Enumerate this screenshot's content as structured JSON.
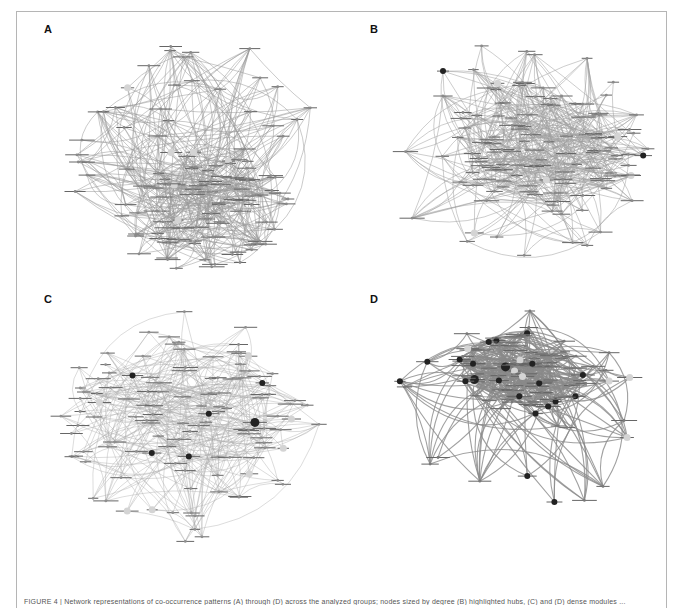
{
  "figure": {
    "panels": [
      {
        "id": "A",
        "label": "A",
        "left": 16,
        "top": 11,
        "seed": 11,
        "nodes": 120,
        "edges": 360,
        "cluster": {
          "cx": 0.55,
          "cy": 0.72,
          "spread": 0.22,
          "weight": 0.55
        },
        "edge_color": "#9a9a9a",
        "edge_width": 0.7,
        "edge_opacity": 0.75,
        "node_color": "#8a8a8a",
        "dark_nodes": 0,
        "big_nodes": 6
      },
      {
        "id": "B",
        "label": "B",
        "left": 342,
        "top": 11,
        "seed": 23,
        "nodes": 125,
        "edges": 380,
        "cluster": {
          "cx": 0.62,
          "cy": 0.5,
          "spread": 0.25,
          "weight": 0.6
        },
        "edge_color": "#a0a0a0",
        "edge_width": 0.7,
        "edge_opacity": 0.75,
        "node_color": "#8a8a8a",
        "dark_nodes": 2,
        "big_nodes": 5
      },
      {
        "id": "C",
        "label": "C",
        "left": 16,
        "top": 281,
        "seed": 37,
        "nodes": 120,
        "edges": 300,
        "cluster": {
          "cx": 0.5,
          "cy": 0.45,
          "spread": 0.28,
          "weight": 0.45
        },
        "edge_color": "#aaaaaa",
        "edge_width": 0.6,
        "edge_opacity": 0.7,
        "node_color": "#8f8f8f",
        "dark_nodes": 6,
        "big_nodes": 8
      },
      {
        "id": "D",
        "label": "D",
        "left": 342,
        "top": 281,
        "seed": 51,
        "nodes": 110,
        "edges": 340,
        "cluster": {
          "cx": 0.55,
          "cy": 0.33,
          "spread": 0.16,
          "weight": 0.65
        },
        "edge_color": "#8a8a8a",
        "edge_width": 1.1,
        "edge_opacity": 0.8,
        "node_color": "#7a7a7a",
        "dark_nodes": 22,
        "big_nodes": 10
      }
    ],
    "dark_node_color": "#222222",
    "halo_color": "#d4d4d4",
    "label_color": "#666666"
  },
  "caption": {
    "text": "FIGURE 4 | Network representations of co-occurrence patterns (A) through (D) across the analyzed groups; nodes sized by degree (B) highlighted hubs, (C) and (D) dense modules ..."
  }
}
